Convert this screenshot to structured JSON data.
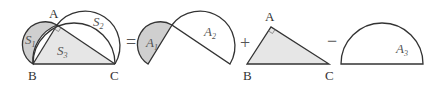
{
  "figure": {
    "colors": {
      "stroke": "#333333",
      "shaded_fill": "#d3d3d3",
      "light_fill": "#e6e6e6",
      "background": "#ffffff"
    },
    "panel1": {
      "points": {
        "A": "A",
        "B": "B",
        "C": "C"
      },
      "regions": {
        "S1": "S",
        "S1_sub": "1",
        "S2": "S",
        "S2_sub": "2",
        "S3": "S",
        "S3_sub": "3"
      }
    },
    "operators": {
      "equals": "=",
      "plus": "+",
      "minus": "−"
    },
    "panel2": {
      "regions": {
        "A1": "A",
        "A1_sub": "1",
        "A2": "A",
        "A2_sub": "2"
      }
    },
    "panel3": {
      "points": {
        "A": "A",
        "B": "B",
        "C": "C"
      }
    },
    "panel4": {
      "regions": {
        "A3": "A",
        "A3_sub": "3"
      }
    }
  }
}
